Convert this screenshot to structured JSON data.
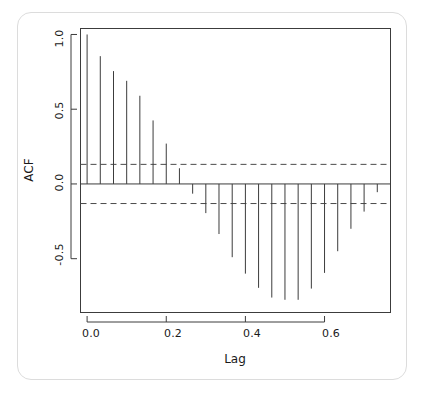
{
  "figure": {
    "kind": "acf-correlogram",
    "background_color": "#ffffff",
    "frame_color": "#dcdcdc",
    "ink_color": "#3c3c3c"
  },
  "chart_data": {
    "type": "bar",
    "title": "",
    "subtitle": "",
    "xlabel": "Lag",
    "ylabel": "ACF",
    "xlim": [
      -0.0167,
      0.7667
    ],
    "ylim": [
      -0.86,
      1.04
    ],
    "xticks": [
      0.0,
      0.2,
      0.4,
      0.6
    ],
    "xtick_labels": [
      "0.0",
      "0.2",
      "0.4",
      "0.6"
    ],
    "yticks": [
      1.0,
      0.5,
      0.0,
      -0.5
    ],
    "ytick_labels": [
      "1.0",
      "0.5",
      "0.0",
      "-0.5"
    ],
    "grid": false,
    "legend": null,
    "zero_line": 0.0,
    "confidence_bands": {
      "label": "95% significance bounds",
      "upper": 0.131,
      "lower": -0.131,
      "style": "dashed",
      "color": "#4a4a4a"
    },
    "lag_step": 0.03333,
    "x": [
      0.0,
      0.0333,
      0.0667,
      0.1,
      0.1333,
      0.1667,
      0.2,
      0.2333,
      0.2667,
      0.3,
      0.3333,
      0.3667,
      0.4,
      0.4333,
      0.4667,
      0.5,
      0.5333,
      0.5667,
      0.6,
      0.6333,
      0.6667,
      0.7,
      0.7333
    ],
    "xtick_values_detail": [
      "0.0",
      "0.0333",
      "0.0667",
      "0.1",
      "0.1333",
      "0.1667",
      "0.2",
      "0.2333",
      "0.2667",
      "0.3",
      "0.3333",
      "0.3667",
      "0.4",
      "0.4333",
      "0.4667",
      "0.5",
      "0.5333",
      "0.5667",
      "0.6",
      "0.6333",
      "0.6667",
      "0.7",
      "0.7333"
    ],
    "categories": [
      "0",
      "1",
      "2",
      "3",
      "4",
      "5",
      "6",
      "7",
      "8",
      "9",
      "10",
      "11",
      "12",
      "13",
      "14",
      "15",
      "16",
      "17",
      "18",
      "19",
      "20",
      "21",
      "22"
    ],
    "values": [
      1.0,
      0.855,
      0.755,
      0.69,
      0.59,
      0.425,
      0.27,
      0.105,
      -0.065,
      -0.195,
      -0.335,
      -0.49,
      -0.6,
      -0.695,
      -0.76,
      -0.775,
      -0.775,
      -0.7,
      -0.595,
      -0.45,
      -0.3,
      -0.185,
      -0.055
    ],
    "series": [
      {
        "name": "ACF",
        "values": [
          1.0,
          0.855,
          0.755,
          0.69,
          0.59,
          0.425,
          0.27,
          0.105,
          -0.065,
          -0.195,
          -0.335,
          -0.49,
          -0.6,
          -0.695,
          -0.76,
          -0.775,
          -0.775,
          -0.7,
          -0.595,
          -0.45,
          -0.3,
          -0.185,
          -0.055
        ]
      }
    ]
  }
}
